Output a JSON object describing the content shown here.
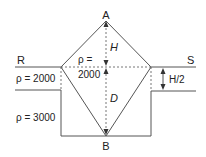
{
  "labels": {
    "A": "A",
    "B": "B",
    "R": "R",
    "S": "S",
    "H": "H",
    "D": "D",
    "half_H": "H/2",
    "rho_upper_left": "ρ = 2000",
    "rho_lower_left": "ρ = 3000",
    "rho_center_line1": "ρ =",
    "rho_center_line2": "2000"
  },
  "colors": {
    "line": "#555555",
    "text": "#222222"
  }
}
